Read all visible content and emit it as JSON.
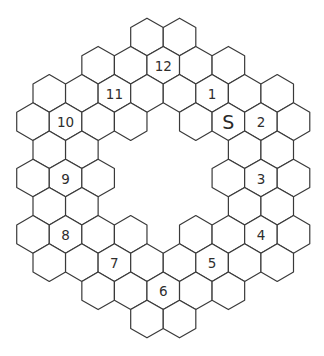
{
  "puzzle": {
    "type": "hex-ring-path",
    "grid_orientation": "pointy-top",
    "rows": [
      {
        "row": 0,
        "cols": [
          3,
          4
        ]
      },
      {
        "row": 1,
        "cols": [
          2,
          3,
          4,
          5,
          6
        ]
      },
      {
        "row": 2,
        "cols": [
          0,
          1,
          2,
          3,
          4,
          5,
          6,
          7
        ]
      },
      {
        "row": 3,
        "cols": [
          0,
          1,
          2,
          3,
          5,
          6,
          7,
          8
        ]
      },
      {
        "row": 4,
        "cols": [
          0,
          1,
          6,
          7
        ]
      },
      {
        "row": 5,
        "cols": [
          0,
          1,
          2,
          6,
          7,
          8
        ]
      },
      {
        "row": 6,
        "cols": [
          0,
          1,
          6,
          7
        ]
      },
      {
        "row": 7,
        "cols": [
          0,
          1,
          2,
          3,
          5,
          6,
          7,
          8
        ]
      },
      {
        "row": 8,
        "cols": [
          0,
          1,
          2,
          3,
          4,
          5,
          6,
          7
        ]
      },
      {
        "row": 9,
        "cols": [
          2,
          3,
          4,
          5,
          6
        ]
      },
      {
        "row": 10,
        "cols": [
          3,
          4
        ]
      }
    ],
    "labels": [
      {
        "row": 1,
        "col": 4,
        "text": "12"
      },
      {
        "row": 2,
        "col": 2,
        "text": "11"
      },
      {
        "row": 2,
        "col": 5,
        "text": "1"
      },
      {
        "row": 3,
        "col": 1,
        "text": "10"
      },
      {
        "row": 3,
        "col": 6,
        "text": "S",
        "start": true
      },
      {
        "row": 3,
        "col": 7,
        "text": "2"
      },
      {
        "row": 5,
        "col": 1,
        "text": "9"
      },
      {
        "row": 5,
        "col": 7,
        "text": "3"
      },
      {
        "row": 7,
        "col": 1,
        "text": "8"
      },
      {
        "row": 7,
        "col": 7,
        "text": "4"
      },
      {
        "row": 8,
        "col": 2,
        "text": "7"
      },
      {
        "row": 8,
        "col": 5,
        "text": "5"
      },
      {
        "row": 9,
        "col": 4,
        "text": "6"
      }
    ],
    "colors": {
      "stroke": "#3a3a3a",
      "fill": "#ffffff",
      "text": "#2e2e2e"
    }
  }
}
